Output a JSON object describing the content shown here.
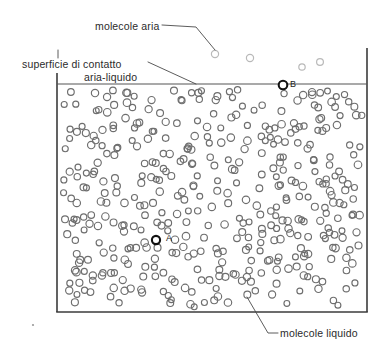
{
  "figure": {
    "background_color": "#ffffff"
  },
  "labels": {
    "molecole_aria": "molecole aria",
    "superficie_line1": "superficie di contatto",
    "superficie_line2": "aria-liquido",
    "molecole_liquido": "molecole liquido",
    "point_a": "A",
    "point_b": "B"
  },
  "colors": {
    "liquid_molecule_stroke": "#6e6e6e",
    "air_molecule_stroke": "#b9b9b9",
    "highlight_molecule_stroke": "#111111",
    "container_stroke": "#3b3b3b",
    "surface_stroke": "#555555",
    "leader_stroke": "#4a4a4a",
    "text_color": "#2b2b2b"
  },
  "container": {
    "left": 57,
    "right": 367,
    "surface_y": 84,
    "bottom_y": 312,
    "wall_top_left_y": 73,
    "wall_top_right_y": 48,
    "stroke_width": 1.6
  },
  "highlight_molecules": [
    {
      "id": "A",
      "cx": 156,
      "cy": 240,
      "r": 4.1
    },
    {
      "id": "B",
      "cx": 283,
      "cy": 85,
      "r": 4.3
    }
  ],
  "air_molecules": [
    {
      "cx": 215,
      "cy": 54,
      "r": 3.6
    },
    {
      "cx": 250,
      "cy": 58,
      "r": 3.6
    },
    {
      "cx": 302,
      "cy": 67,
      "r": 3.2
    },
    {
      "cx": 320,
      "cy": 62,
      "r": 3.4
    }
  ],
  "leaders": [
    {
      "name": "leader-molecole-aria",
      "points": "162,25 196,27 215,50"
    },
    {
      "name": "leader-superficie",
      "points": "148,62 196,84"
    },
    {
      "name": "leader-molecole-liquido",
      "points": "247,297 268,333 278,333"
    },
    {
      "name": "tick-superficie",
      "points": "58,50 58,58"
    }
  ],
  "speck": {
    "cx": 33,
    "cy": 325,
    "r": 1.1
  },
  "liquid_molecules": {
    "radius_min": 2.9,
    "radius_max": 3.8,
    "stroke_width": 1.15,
    "count": 430,
    "seed": 20240711,
    "region": {
      "x0": 60,
      "y0": 86,
      "x1": 365,
      "y1": 310
    }
  }
}
